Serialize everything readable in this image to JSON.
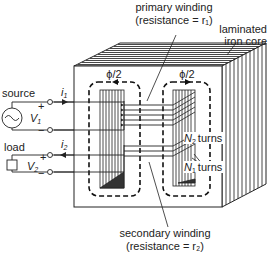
{
  "diagram": {
    "type": "transformer-schematic",
    "labels": {
      "primary_winding": "primary winding",
      "primary_resistance": "(resistance = r₁)",
      "laminated_line1": "laminated",
      "laminated_line2": "iron core",
      "flux_left": "ϕ/2",
      "flux_right": "ϕ/2",
      "source": "source",
      "load": "load",
      "v1": "V",
      "v1_sub": "1",
      "v2": "V",
      "v2_sub": "2",
      "i1": "i",
      "i1_sub": "1",
      "i2": "i",
      "i2_sub": "2",
      "n2_turns": "N",
      "n2_sub": "2",
      "n1_turns": "N",
      "n1_sub": "1",
      "turns": "turns",
      "secondary_winding": "secondary winding",
      "secondary_resistance": "(resistance = r₂)",
      "plus": "+",
      "minus": "−"
    },
    "components": [
      "ac-source",
      "load-resistor",
      "laminated-iron-core",
      "primary-winding",
      "secondary-winding",
      "flux-path-left",
      "flux-path-right"
    ]
  }
}
